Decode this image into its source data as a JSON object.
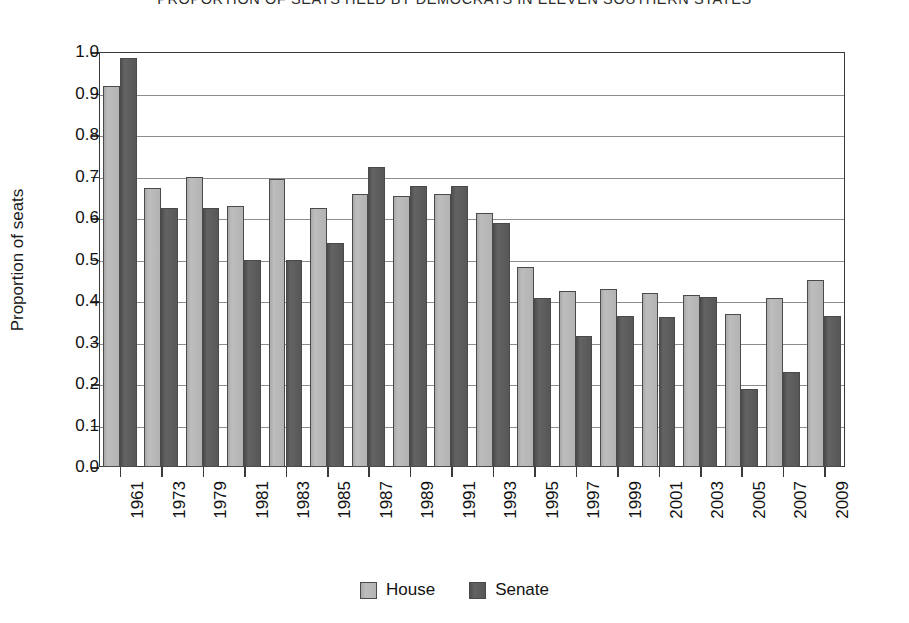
{
  "chart_data": {
    "type": "bar",
    "title": "PROPORTION OF SEATS HELD BY DEMOCRATS IN ELEVEN SOUTHERN STATES",
    "xlabel": "",
    "ylabel": "Proportion of seats",
    "ylim": [
      0.0,
      1.0
    ],
    "ytick_labels": [
      "1.0",
      "0.9",
      "0.8",
      "0.7",
      "0.6",
      "0.5",
      "0.4",
      "0.3",
      "0.2",
      "0.1",
      "0.0"
    ],
    "ytick_values": [
      1.0,
      0.9,
      0.8,
      0.7,
      0.6,
      0.5,
      0.4,
      0.3,
      0.2,
      0.1,
      0.0
    ],
    "grid": true,
    "legend_position": "bottom-center",
    "categories": [
      "1961",
      "1973",
      "1979",
      "1981",
      "1983",
      "1985",
      "1987",
      "1989",
      "1991",
      "1993",
      "1995",
      "1997",
      "1999",
      "2001",
      "2003",
      "2005",
      "2007",
      "2009"
    ],
    "series": [
      {
        "name": "House",
        "color": "#b3b3b3",
        "values": [
          0.918,
          0.672,
          0.698,
          0.63,
          0.695,
          0.625,
          0.658,
          0.653,
          0.658,
          0.613,
          0.482,
          0.424,
          0.428,
          0.419,
          0.414,
          0.368,
          0.408,
          0.45
        ]
      },
      {
        "name": "Senate",
        "color": "#575757",
        "values": [
          0.985,
          0.623,
          0.625,
          0.5,
          0.5,
          0.541,
          0.723,
          0.678,
          0.678,
          0.587,
          0.407,
          0.315,
          0.363,
          0.362,
          0.41,
          0.188,
          0.228,
          0.363
        ]
      }
    ]
  }
}
